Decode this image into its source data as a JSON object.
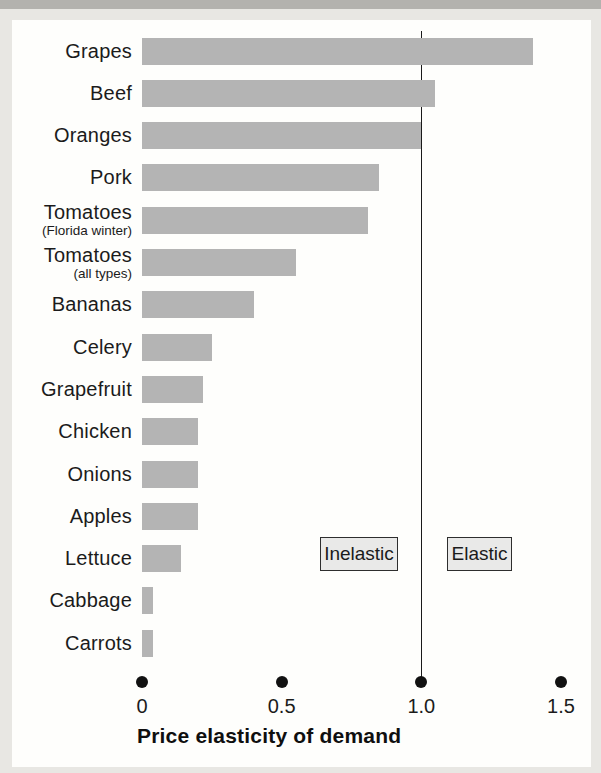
{
  "chart_data": {
    "type": "bar",
    "orientation": "horizontal",
    "xlabel": "Price elasticity of demand",
    "xlim": [
      0,
      1.5
    ],
    "xticks": [
      0,
      0.5,
      1.0,
      1.5
    ],
    "xtick_labels": [
      "0",
      "0.5",
      "1.0",
      "1.5"
    ],
    "tick_marker": "filled-circle",
    "grid": false,
    "legend": "none",
    "bar_color": "#b4b4b4",
    "reference_line": {
      "x": 1.0,
      "color": "#1a1a1a",
      "label_left": "Inelastic",
      "label_right": "Elastic"
    },
    "rows": [
      {
        "label": "Grapes",
        "sublabel": "",
        "value": 1.4
      },
      {
        "label": "Beef",
        "sublabel": "",
        "value": 1.05
      },
      {
        "label": "Oranges",
        "sublabel": "",
        "value": 1.0
      },
      {
        "label": "Pork",
        "sublabel": "",
        "value": 0.85
      },
      {
        "label": "Tomatoes",
        "sublabel": "(Florida winter)",
        "value": 0.81
      },
      {
        "label": "Tomatoes",
        "sublabel": "(all types)",
        "value": 0.55
      },
      {
        "label": "Bananas",
        "sublabel": "",
        "value": 0.4
      },
      {
        "label": "Celery",
        "sublabel": "",
        "value": 0.25
      },
      {
        "label": "Grapefruit",
        "sublabel": "",
        "value": 0.22
      },
      {
        "label": "Chicken",
        "sublabel": "",
        "value": 0.2
      },
      {
        "label": "Onions",
        "sublabel": "",
        "value": 0.2
      },
      {
        "label": "Apples",
        "sublabel": "",
        "value": 0.2
      },
      {
        "label": "Lettuce",
        "sublabel": "",
        "value": 0.14
      },
      {
        "label": "Cabbage",
        "sublabel": "",
        "value": 0.04
      },
      {
        "label": "Carrots",
        "sublabel": "",
        "value": 0.04
      }
    ]
  }
}
